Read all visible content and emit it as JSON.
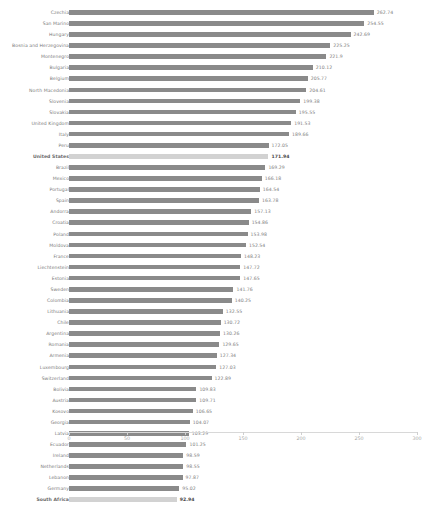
{
  "chart_data": {
    "type": "bar",
    "orientation": "horizontal",
    "title": "",
    "xlabel": "",
    "ylabel": "",
    "xlim": [
      0,
      300
    ],
    "xticks": [
      0,
      50,
      100,
      150,
      200,
      250,
      300
    ],
    "grid": false,
    "legend": "none",
    "bar_color": "#8a8a8a",
    "highlight_color": "#d2d2d2",
    "highlighted": [
      "United States",
      "South Africa"
    ],
    "categories": [
      "Czechia",
      "San Marino",
      "Hungary",
      "Bosnia and Herzegovina",
      "Montenegro",
      "Bulgaria",
      "Belgium",
      "North Macedonia",
      "Slovenia",
      "Slovakia",
      "United Kingdom",
      "Italy",
      "Peru",
      "United States",
      "Brazil",
      "Mexico",
      "Portugal",
      "Spain",
      "Andorra",
      "Croatia",
      "Poland",
      "Moldova",
      "France",
      "Liechtenstein",
      "Estonia",
      "Sweden",
      "Colombia",
      "Lithuania",
      "Chile",
      "Argentina",
      "Romania",
      "Armenia",
      "Luxembourg",
      "Switzerland",
      "Bolivia",
      "Austria",
      "Kosovo",
      "Georgia",
      "Latvia",
      "Ecuador",
      "Ireland",
      "Netherlands",
      "Lebanon",
      "Germany",
      "South Africa"
    ],
    "values": [
      262.74,
      254.55,
      242.69,
      225.25,
      221.9,
      210.12,
      205.77,
      204.61,
      199.38,
      195.55,
      191.53,
      189.66,
      172.05,
      171.94,
      169.29,
      166.18,
      164.54,
      163.78,
      157.13,
      154.86,
      153.98,
      152.54,
      148.23,
      147.72,
      147.65,
      141.76,
      140.25,
      132.55,
      130.72,
      130.26,
      129.65,
      127.34,
      127.03,
      122.89,
      109.83,
      109.71,
      106.65,
      104.07,
      103.29,
      101.25,
      98.59,
      98.55,
      97.87,
      95.02,
      92.94
    ],
    "value_labels": [
      "262.74",
      "254.55",
      "242.69",
      "225.25",
      "221.9",
      "210.12",
      "205.77",
      "204.61",
      "199.38",
      "195.55",
      "191.53",
      "189.66",
      "172.05",
      "171.94",
      "169.29",
      "166.18",
      "164.54",
      "163.78",
      "157.13",
      "154.86",
      "153.98",
      "152.54",
      "148.23",
      "147.72",
      "147.65",
      "141.76",
      "140.25",
      "132.55",
      "130.72",
      "130.26",
      "129.65",
      "127.34",
      "127.03",
      "122.89",
      "109.83",
      "109.71",
      "106.65",
      "104.07",
      "103.29",
      "101.25",
      "98.59",
      "98.55",
      "97.87",
      "95.02",
      "92.94"
    ]
  }
}
